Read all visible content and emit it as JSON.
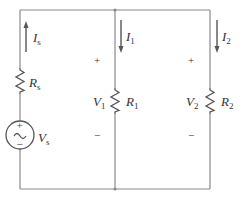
{
  "diagram": {
    "type": "circuit",
    "colors": {
      "wire": "#8a8a8a",
      "component": "#555555",
      "text": "#333333"
    },
    "source": {
      "label": "V",
      "subscript": "s",
      "plus": "+",
      "minus": "−",
      "symbol": "~"
    },
    "source_resistor": {
      "label": "R",
      "subscript": "s"
    },
    "source_current": {
      "label": "I",
      "subscript": "s",
      "direction": "up"
    },
    "branch1": {
      "resistor": {
        "label": "R",
        "subscript": "1"
      },
      "current": {
        "label": "I",
        "subscript": "1",
        "direction": "down"
      },
      "voltage": {
        "label": "V",
        "subscript": "1",
        "plus": "+",
        "minus": "−"
      }
    },
    "branch2": {
      "resistor": {
        "label": "R",
        "subscript": "2"
      },
      "current": {
        "label": "I",
        "subscript": "2",
        "direction": "down"
      },
      "voltage": {
        "label": "V",
        "subscript": "2",
        "plus": "+",
        "minus": "−"
      }
    }
  }
}
